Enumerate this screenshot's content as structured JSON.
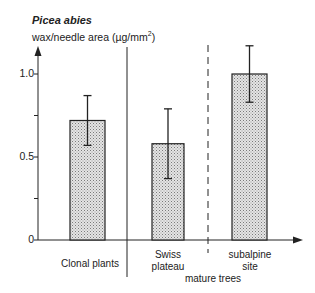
{
  "chart_data": {
    "type": "bar",
    "title": "Picea abies",
    "ylabel": "wax/needle area (µg/mm2)",
    "xlabel": "",
    "ylim": [
      0,
      1.2
    ],
    "yticks": [
      0,
      0.25,
      0.5,
      0.75,
      1.0
    ],
    "ytick_labels": [
      "0",
      "",
      "0.5",
      "",
      "1.0"
    ],
    "grid": false,
    "legend": null,
    "categories": [
      "Clonal plants",
      "Swiss plateau",
      "subalpine site"
    ],
    "values": [
      0.72,
      0.58,
      1.0
    ],
    "error_bars": [
      {
        "low": 0.57,
        "high": 0.87
      },
      {
        "low": 0.37,
        "high": 0.79
      },
      {
        "low": 0.83,
        "high": 1.17
      }
    ],
    "group_labels": [
      {
        "label": "mature trees",
        "spans": [
          "Swiss plateau",
          "subalpine site"
        ]
      }
    ],
    "dividers": [
      {
        "between": [
          "Clonal plants",
          "Swiss plateau"
        ],
        "style": "solid"
      },
      {
        "between": [
          "Swiss plateau",
          "subalpine site"
        ],
        "style": "dashed"
      }
    ],
    "bar_fill": "stippled gray",
    "colors": {
      "bar_fill": "#c8c8c8",
      "line": "#222222"
    }
  },
  "labels": {
    "title": "Picea abies",
    "ylabel_main": "wax/needle area (µg/mm",
    "ylabel_sup": "2",
    "ylabel_end": ")",
    "tick_0": "0",
    "tick_05": "0.5",
    "tick_10": "1.0",
    "cat1": "Clonal plants",
    "cat2_line1": "Swiss",
    "cat2_line2": "plateau",
    "cat3_line1": "subalpine",
    "cat3_line2": "site",
    "group": "mature trees"
  }
}
